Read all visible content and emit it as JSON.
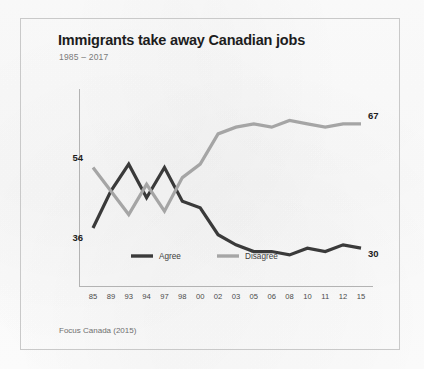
{
  "figure": {
    "title": "Immigrants take away Canadian jobs",
    "subtitle": "1985 – 2017",
    "source": "Focus Canada (2015)"
  },
  "colors": {
    "agree": "#3a3a3a",
    "disagree": "#a5a5a5",
    "axis": "#b3b3b3",
    "frame": "#c9c9c9",
    "title_text": "#1d1d1d",
    "subtitle_text": "#7a7a7a",
    "source_text": "#6f6f6f",
    "background": "#fdfdfd"
  },
  "chart_data": {
    "type": "line",
    "title": "Immigrants take away Canadian jobs",
    "subtitle": "1985 – 2017",
    "xlabel": "",
    "ylabel": "",
    "ylim": [
      25,
      72
    ],
    "grid": false,
    "legend_position": "bottom-center",
    "categories": [
      "85",
      "89",
      "93",
      "94",
      "97",
      "98",
      "00",
      "02",
      "03",
      "05",
      "06",
      "08",
      "10",
      "11",
      "12",
      "15"
    ],
    "series": [
      {
        "name": "Agree",
        "color": "#3a3a3a",
        "values": [
          36,
          47,
          55,
          45,
          54,
          44,
          42,
          34,
          31,
          29,
          29,
          28,
          30,
          29,
          31,
          30
        ],
        "start_label": "36",
        "end_label": "30"
      },
      {
        "name": "Disagree",
        "color": "#a5a5a5",
        "values": [
          54,
          47,
          40,
          49,
          41,
          51,
          55,
          64,
          66,
          67,
          66,
          68,
          67,
          66,
          67,
          67
        ],
        "start_label": "54",
        "end_label": "67"
      }
    ],
    "annotations": [
      {
        "text": "54",
        "series": "Disagree",
        "position": "left-top"
      },
      {
        "text": "36",
        "series": "Agree",
        "position": "left-bottom"
      },
      {
        "text": "67",
        "series": "Disagree",
        "position": "right-top"
      },
      {
        "text": "30",
        "series": "Agree",
        "position": "right-bottom"
      }
    ],
    "source_note": "Focus Canada (2015)"
  },
  "legend": {
    "items": [
      {
        "label": "Agree",
        "color": "#3a3a3a"
      },
      {
        "label": "Disagree",
        "color": "#a5a5a5"
      }
    ]
  },
  "axis": {
    "tick_labels": [
      "85",
      "89",
      "93",
      "94",
      "97",
      "98",
      "00",
      "02",
      "03",
      "05",
      "06",
      "08",
      "10",
      "11",
      "12",
      "15"
    ]
  }
}
